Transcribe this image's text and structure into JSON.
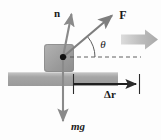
{
  "figure": {
    "kind": "free-body-diagram",
    "background_color": "#fdfdfd",
    "labels": {
      "normal_force": "n",
      "applied_force": "F",
      "angle": "θ",
      "displacement": "Δr",
      "weight": "mg"
    },
    "colors": {
      "arrow_dark": "#2b2b2b",
      "arrow_gray": "#8f8f8f",
      "block_fill": "#9a9a9a",
      "ground_fill": "#a8a8a8",
      "motion_arrow": "#b4b4b4",
      "dashed_line": "#555555",
      "pivot_dot": "#111111"
    },
    "elements": [
      {
        "name": "normal-force-vector",
        "label": "n",
        "direction": "up",
        "origin": [
          63,
          57
        ],
        "tip": [
          72,
          9
        ]
      },
      {
        "name": "applied-force-vector",
        "label": "F",
        "direction": "up-right",
        "origin": [
          63,
          57
        ],
        "tip": [
          116,
          12
        ],
        "angle_deg": 40
      },
      {
        "name": "weight-vector",
        "label": "mg",
        "direction": "down",
        "origin": [
          63,
          57
        ],
        "tip": [
          63,
          126
        ]
      },
      {
        "name": "angle-arc",
        "label": "θ",
        "vertex": [
          63,
          57
        ],
        "between": [
          "applied-force-vector",
          "horizontal-dashed-line"
        ]
      },
      {
        "name": "horizontal-dashed-line",
        "from": [
          63,
          57
        ],
        "to": [
          140,
          57
        ]
      },
      {
        "name": "displacement-vector",
        "label": "Δr",
        "from": [
          73,
          84
        ],
        "to": [
          140,
          84
        ]
      },
      {
        "name": "motion-indicator-arrow",
        "direction": "right",
        "from": [
          122,
          39
        ],
        "to": [
          158,
          39
        ]
      },
      {
        "name": "block",
        "rect": [
          44,
          44,
          30,
          27
        ]
      },
      {
        "name": "ground-surface",
        "rect": [
          8,
          72,
          110,
          14
        ]
      },
      {
        "name": "pivot-dot",
        "at": [
          63,
          57
        ]
      }
    ]
  }
}
